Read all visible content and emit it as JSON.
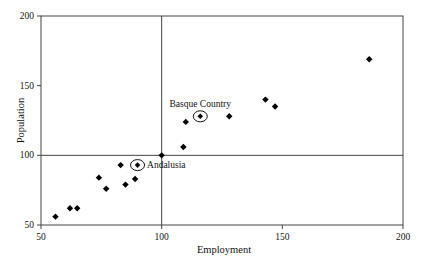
{
  "chart_data": {
    "type": "scatter",
    "title": "",
    "xlabel": "Employment",
    "ylabel": "Population",
    "xlim": [
      50,
      200
    ],
    "ylim": [
      50,
      200
    ],
    "xticks": [
      50,
      100,
      150,
      200
    ],
    "yticks": [
      50,
      100,
      150,
      200
    ],
    "grid": false,
    "legend": "none",
    "marker": "diamond",
    "marker_color": "#000000",
    "frame_color": "#444444",
    "reference_lines": {
      "x": 100,
      "y": 100
    },
    "points": [
      {
        "x": 56,
        "y": 56
      },
      {
        "x": 62,
        "y": 62
      },
      {
        "x": 65,
        "y": 62
      },
      {
        "x": 74,
        "y": 84
      },
      {
        "x": 77,
        "y": 76
      },
      {
        "x": 83,
        "y": 93
      },
      {
        "x": 85,
        "y": 79
      },
      {
        "x": 89,
        "y": 83
      },
      {
        "x": 100,
        "y": 100
      },
      {
        "x": 109,
        "y": 106
      },
      {
        "x": 110,
        "y": 124
      },
      {
        "x": 128,
        "y": 128
      },
      {
        "x": 143,
        "y": 140
      },
      {
        "x": 147,
        "y": 135
      },
      {
        "x": 186,
        "y": 169
      }
    ],
    "annotations": [
      {
        "label": "Basque Country",
        "x": 116,
        "y": 128,
        "circled": true,
        "label_position": "above"
      },
      {
        "label": "Andalusia",
        "x": 90,
        "y": 93,
        "circled": true,
        "label_position": "right"
      }
    ]
  }
}
